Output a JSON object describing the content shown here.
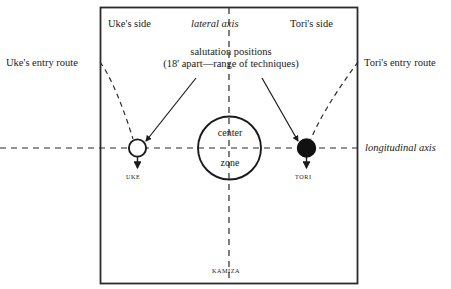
{
  "diagram": {
    "title_labels": {
      "uke_side": "Uke's side",
      "lateral_axis": "lateral axis",
      "tori_side": "Tori's side"
    },
    "entry_routes": {
      "uke": "Uke's entry route",
      "tori": "Tori's entry route"
    },
    "axes": {
      "longitudinal": "longitudinal axis"
    },
    "annotation": {
      "line1": "salutation positions",
      "line2": "(18' apart—range of techniques)"
    },
    "center_zone": {
      "line1": "center",
      "line2": "zone"
    },
    "markers": {
      "uke": "UKE",
      "tori": "TORI"
    },
    "bottom": {
      "kamiza": "KAMIZA"
    },
    "colors": {
      "ink": "#1a1a1a",
      "line": "#2b2b2b",
      "background": "#ffffff",
      "tori_fill": "#111111",
      "uke_fill": "#ffffff"
    }
  }
}
